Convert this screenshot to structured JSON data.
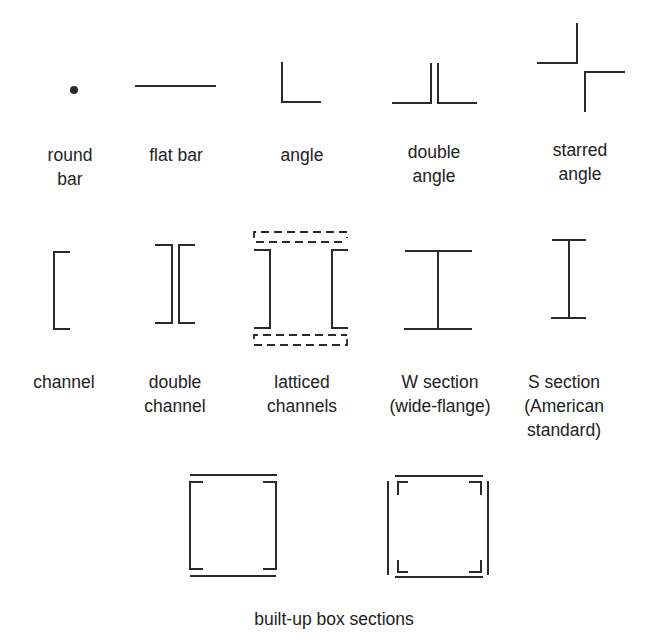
{
  "diagram": {
    "row1": [
      {
        "label_line1": "round",
        "label_line2": "bar"
      },
      {
        "label_line1": "flat bar",
        "label_line2": ""
      },
      {
        "label_line1": "angle",
        "label_line2": ""
      },
      {
        "label_line1": "double",
        "label_line2": "angle"
      },
      {
        "label_line1": "starred",
        "label_line2": "angle"
      }
    ],
    "row2": [
      {
        "label_line1": "channel",
        "label_line2": "",
        "label_line3": ""
      },
      {
        "label_line1": "double",
        "label_line2": "channel",
        "label_line3": ""
      },
      {
        "label_line1": "latticed",
        "label_line2": "channels",
        "label_line3": ""
      },
      {
        "label_line1": "W section",
        "label_line2": "(wide-flange)",
        "label_line3": ""
      },
      {
        "label_line1": "S section",
        "label_line2": "(American",
        "label_line3": "standard)"
      }
    ],
    "row3": {
      "caption": "built-up box sections"
    },
    "line_color": "#2a2a2a"
  }
}
